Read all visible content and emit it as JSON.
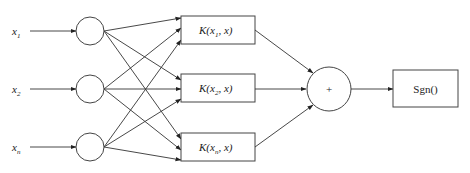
{
  "diagram": {
    "type": "svm-kernel-network",
    "colors": {
      "stroke": "#333333",
      "background": "#ffffff",
      "text": "#222222"
    },
    "inputs": [
      {
        "id": "x1",
        "base": "x",
        "sub": "1"
      },
      {
        "id": "x2",
        "base": "x",
        "sub": "2"
      },
      {
        "id": "xn",
        "base": "x",
        "sub": "n"
      }
    ],
    "kernels": [
      {
        "id": "k1",
        "prefix": "K(x",
        "sub": "1",
        "suffix": ", x)"
      },
      {
        "id": "k2",
        "prefix": "K(x",
        "sub": "2",
        "suffix": ", x)"
      },
      {
        "id": "kn",
        "prefix": "K(x",
        "sub": "n",
        "suffix": ", x)"
      }
    ],
    "sum_node": {
      "symbol": "+"
    },
    "output_node": {
      "label": "Sgn()"
    },
    "edges": [
      "x1->c1",
      "x2->c2",
      "xn->c3",
      "c1->k1",
      "c1->k2",
      "c1->kn",
      "c2->k1",
      "c2->k2",
      "c2->kn",
      "c3->k1",
      "c3->k2",
      "c3->kn",
      "k1->sum",
      "k2->sum",
      "kn->sum",
      "sum->sgn"
    ]
  }
}
